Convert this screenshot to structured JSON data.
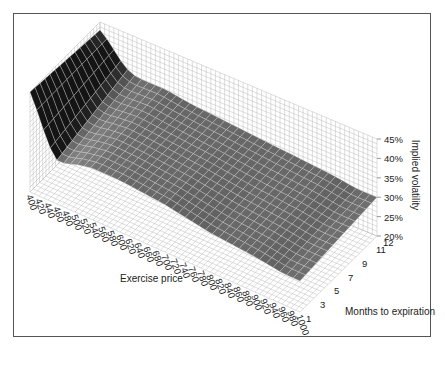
{
  "chart_data": {
    "type": "surface3d",
    "title": "",
    "xlabel": "Exercise price",
    "ylabel": "Months to expiration",
    "zlabel": "Implied volatility",
    "x_ticks": [
      "400",
      "420",
      "440",
      "460",
      "480",
      "500",
      "520",
      "540",
      "560",
      "580",
      "600",
      "620",
      "640",
      "660",
      "680",
      "700",
      "720",
      "740",
      "760",
      "780",
      "800",
      "820",
      "840",
      "860",
      "880",
      "900",
      "920",
      "940",
      "960",
      "980",
      "1000"
    ],
    "y_ticks": [
      "1",
      "3",
      "5",
      "7",
      "9",
      "11",
      "12"
    ],
    "z_ticks": [
      "20%",
      "25%",
      "30%",
      "35%",
      "40%",
      "45%"
    ],
    "zlim": [
      0.2,
      0.45
    ],
    "xlim": [
      400,
      1000
    ],
    "ylim": [
      1,
      12
    ],
    "grid": true,
    "surface_profile": {
      "description": "Implied volatility by exercise price (rows) at short and long maturities",
      "exercise_price": [
        400,
        420,
        440,
        460,
        480,
        500,
        540,
        600,
        700,
        800,
        900,
        960,
        1000
      ],
      "vol_1_month": [
        0.45,
        0.4,
        0.34,
        0.31,
        0.31,
        0.32,
        0.33,
        0.33,
        0.32,
        0.3,
        0.29,
        0.28,
        0.28
      ],
      "vol_12_month": [
        0.43,
        0.41,
        0.38,
        0.36,
        0.35,
        0.35,
        0.35,
        0.34,
        0.33,
        0.32,
        0.31,
        0.3,
        0.3
      ]
    }
  },
  "labels": {
    "x_axis": "Exercise price",
    "y_axis": "Months to expiration",
    "z_axis": "Implied volatility"
  }
}
